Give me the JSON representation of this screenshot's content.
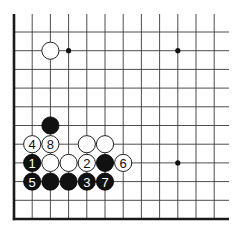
{
  "diagram": {
    "type": "go-board-fragment",
    "corner": "bottom-left",
    "columns": 12,
    "rows": 11,
    "edges": [
      "left",
      "bottom"
    ],
    "colors": {
      "black": "#111111",
      "white": "#ffffff",
      "line": "#3a3a3a"
    },
    "star_points": [
      {
        "col": 3,
        "row": 1
      },
      {
        "col": 9,
        "row": 1
      },
      {
        "col": 9,
        "row": 7
      },
      {
        "col": 3,
        "row": 7
      }
    ],
    "stones": [
      {
        "col": 2,
        "row": 1,
        "color": "white",
        "label": ""
      },
      {
        "col": 2,
        "row": 5,
        "color": "black",
        "label": ""
      },
      {
        "col": 1,
        "row": 6,
        "color": "white",
        "label": "4"
      },
      {
        "col": 2,
        "row": 6,
        "color": "white",
        "label": "8"
      },
      {
        "col": 4,
        "row": 6,
        "color": "white",
        "label": ""
      },
      {
        "col": 5,
        "row": 6,
        "color": "white",
        "label": ""
      },
      {
        "col": 1,
        "row": 7,
        "color": "black",
        "label": "1"
      },
      {
        "col": 2,
        "row": 7,
        "color": "white",
        "label": ""
      },
      {
        "col": 3,
        "row": 7,
        "color": "white",
        "label": ""
      },
      {
        "col": 4,
        "row": 7,
        "color": "white",
        "label": "2"
      },
      {
        "col": 5,
        "row": 7,
        "color": "black",
        "label": ""
      },
      {
        "col": 6,
        "row": 7,
        "color": "white",
        "label": "6"
      },
      {
        "col": 1,
        "row": 8,
        "color": "black",
        "label": "5"
      },
      {
        "col": 2,
        "row": 8,
        "color": "black",
        "label": ""
      },
      {
        "col": 3,
        "row": 8,
        "color": "black",
        "label": ""
      },
      {
        "col": 4,
        "row": 8,
        "color": "black",
        "label": "3"
      },
      {
        "col": 5,
        "row": 8,
        "color": "black",
        "label": "7"
      }
    ]
  }
}
